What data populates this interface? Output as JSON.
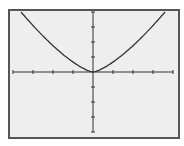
{
  "chart_data": {
    "type": "line",
    "title": "",
    "xlabel": "",
    "ylabel": "",
    "xlim": [
      -4,
      4
    ],
    "ylim": [
      -4,
      4
    ],
    "x_ticks": [
      -4,
      -3,
      -2,
      -1,
      0,
      1,
      2,
      3,
      4
    ],
    "y_ticks": [
      -4,
      -3,
      -2,
      -1,
      0,
      1,
      2,
      3,
      4
    ],
    "grid": false,
    "tick_labels_shown": false,
    "series": [
      {
        "name": "f(x)",
        "description": "U/V-shaped curve with vertex at origin, rising to top of window near x=±3.6",
        "x": [
          -3.6,
          -3,
          -2,
          -1,
          -0.5,
          0,
          0.5,
          1,
          2,
          3,
          3.6
        ],
        "y": [
          4,
          3.1,
          1.9,
          0.85,
          0.4,
          0,
          0.4,
          0.85,
          1.9,
          3.1,
          4
        ]
      }
    ]
  },
  "colors": {
    "background": "#eeeeee",
    "frame": "#555555",
    "axis": "#333333",
    "curve": "#333333"
  }
}
